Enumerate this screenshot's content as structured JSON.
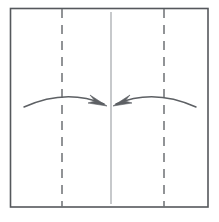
{
  "figure": {
    "title": "Origami fold step diagram",
    "description": "Square sheet with two vertical crease lines and two curved arrows folding the left and right edges toward the vertical center line",
    "background_color": "#ffffff"
  },
  "canvas": {
    "width": 219,
    "height": 222
  },
  "paper": {
    "label": "paper-square",
    "x": 10.5,
    "y": 8.5,
    "width": 197.5,
    "height": 198.5,
    "stroke_color": "#55585c",
    "stroke_width": 1.6,
    "fill_color": "#ffffff"
  },
  "center_line": {
    "label": "center-reference-line",
    "x": 111,
    "y_top": 12,
    "y_bottom": 204,
    "stroke_color": "#b9bcbf",
    "stroke_width": 1.6,
    "style": "solid"
  },
  "creases": [
    {
      "label": "left-crease-line",
      "x": 62,
      "y_top": 9,
      "y_bottom": 207,
      "stroke_color": "#6d7074",
      "stroke_width": 1.5,
      "style": "dashed",
      "dash_pattern": "9 7"
    },
    {
      "label": "right-crease-line",
      "x": 164,
      "y_top": 9,
      "y_bottom": 207,
      "stroke_color": "#6d7074",
      "stroke_width": 1.5,
      "style": "dashed",
      "dash_pattern": "9 7"
    }
  ],
  "arrows": [
    {
      "label": "left-fold-arrow",
      "direction": "right",
      "start_x": 24,
      "start_y": 107,
      "control_x": 66,
      "control_y": 88,
      "end_x": 104,
      "end_y": 104,
      "tip_x": 107,
      "tip_y": 106,
      "stroke_color": "#5d6064",
      "stroke_width": 1.5,
      "head_color": "#5d6064"
    },
    {
      "label": "right-fold-arrow",
      "direction": "left",
      "start_x": 196,
      "start_y": 107,
      "control_x": 154,
      "control_y": 88,
      "end_x": 116,
      "end_y": 104,
      "tip_x": 113,
      "tip_y": 106,
      "stroke_color": "#5d6064",
      "stroke_width": 1.5,
      "head_color": "#5d6064"
    }
  ]
}
